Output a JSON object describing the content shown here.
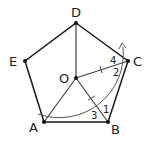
{
  "diagram": {
    "points": {
      "A": {
        "label": "A"
      },
      "B": {
        "label": "B"
      },
      "C": {
        "label": "C"
      },
      "D": {
        "label": "D"
      },
      "E": {
        "label": "E"
      },
      "O": {
        "label": "O"
      }
    },
    "angles": {
      "a1": "1",
      "a2": "2",
      "a3": "3",
      "a4": "4"
    },
    "colors": {
      "stroke": "#1a1a1a",
      "segment": "#444444",
      "arc": "#555555"
    }
  }
}
